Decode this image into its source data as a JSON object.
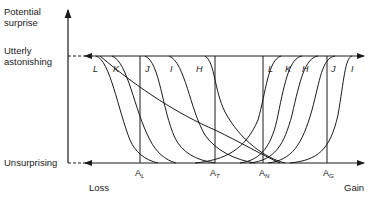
{
  "axes": {
    "y_title_line1": "Potential",
    "y_title_line2": "surprise",
    "top_level_line1": "Utterly",
    "top_level_line2": "astonishing",
    "bottom_level": "Unsurprising",
    "x_left": "Loss",
    "x_right": "Gain"
  },
  "curves_left": [
    "L",
    "K",
    "J",
    "I",
    "H"
  ],
  "curves_right": [
    "L",
    "K",
    "H",
    "J",
    "I"
  ],
  "markers": [
    {
      "base": "A",
      "sub": "L"
    },
    {
      "base": "A",
      "sub": "T"
    },
    {
      "base": "A",
      "sub": "N"
    },
    {
      "base": "A",
      "sub": "G"
    }
  ],
  "colors": {
    "ink": "#1a1a1a",
    "background": "#ffffff"
  }
}
